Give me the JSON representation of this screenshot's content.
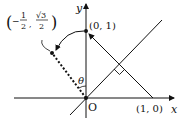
{
  "diagram": {
    "axes": {
      "x_label": "x",
      "y_label": "y",
      "origin_label": "O"
    },
    "points": [
      {
        "id": "p01",
        "label": "(0, 1)"
      },
      {
        "id": "p10",
        "label": "(1, 0)"
      },
      {
        "id": "prot",
        "label_prefix": "−",
        "num1": "1",
        "den1": "2",
        "num2": "√3",
        "den2": "2"
      }
    ],
    "angle_label": "θ",
    "colors": {
      "stroke": "#111111",
      "background": "#ffffff"
    }
  }
}
